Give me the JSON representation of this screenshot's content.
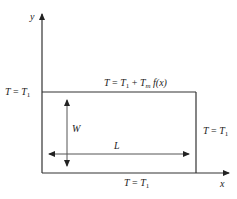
{
  "diagram": {
    "type": "boundary-value-problem-rectangle",
    "axes": {
      "x_label": "x",
      "y_label": "y"
    },
    "boundaries": {
      "top": {
        "T": "T",
        "eq": " = ",
        "T1": "T",
        "T1_sub": "1",
        "plus": " + ",
        "Tm": "T",
        "Tm_sub": "m",
        "f": " f(x)"
      },
      "left": {
        "T": "T",
        "eq": " = ",
        "T1": "T",
        "T1_sub": "1"
      },
      "right": {
        "T": "T",
        "eq": " = ",
        "T1": "T",
        "T1_sub": "1"
      },
      "bottom": {
        "T": "T",
        "eq": " = ",
        "T1": "T",
        "T1_sub": "1"
      }
    },
    "dimensions": {
      "width_label": "W",
      "length_label": "L"
    },
    "colors": {
      "axis": "#333333",
      "box": "#333333",
      "dimension": "#555555",
      "text": "#222222"
    }
  }
}
